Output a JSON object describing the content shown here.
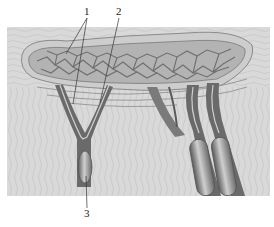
{
  "figure": {
    "labels": [
      {
        "id": "1",
        "text": "1"
      },
      {
        "id": "2",
        "text": "2"
      },
      {
        "id": "3",
        "text": "3"
      }
    ],
    "colors": {
      "background": "#d9d9d9",
      "tissue_lines": "#b8b8b8",
      "network_fill": "#a8a8a8",
      "network_vessels": "#6f6f6f",
      "vessel_dark": "#5a5a5a",
      "vessel_light": "#c9c9c9",
      "leader_lines": "#333333"
    }
  }
}
